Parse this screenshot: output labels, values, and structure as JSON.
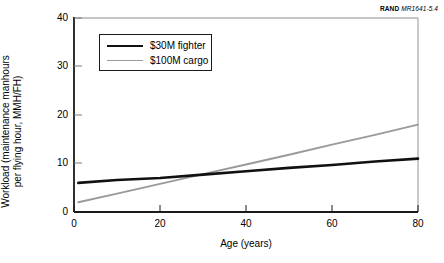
{
  "caption": {
    "wordmark": "RAND",
    "report_number": "MR1641-5.4"
  },
  "chart_data": {
    "type": "line",
    "title": "",
    "xlabel": "Age (years)",
    "ylabel": "Workload  (maintenance manhours per flying hour, MMH/FH)",
    "ylabel_line1": "Workload  (maintenance manhours",
    "ylabel_line2": "per flying hour, MMH/FH)",
    "xlim": [
      0,
      80
    ],
    "ylim": [
      0,
      40
    ],
    "xticks": [
      0,
      20,
      40,
      60,
      80
    ],
    "yticks": [
      0,
      10,
      20,
      30,
      40
    ],
    "xtick_labels": [
      "0",
      "20",
      "40",
      "60",
      "80"
    ],
    "ytick_labels": [
      "0",
      "10",
      "20",
      "30",
      "40"
    ],
    "grid": false,
    "legend_position": "upper left",
    "series": [
      {
        "name": "$30M fighter",
        "color": "#111111",
        "width": 2.6,
        "x": [
          1,
          10,
          20,
          30,
          40,
          50,
          60,
          70,
          80
        ],
        "values": [
          6.0,
          6.6,
          7.0,
          7.7,
          8.4,
          9.1,
          9.7,
          10.4,
          11.0
        ]
      },
      {
        "name": "$100M cargo",
        "color": "#9a9a9a",
        "width": 1.9,
        "x": [
          1,
          10,
          20,
          30,
          40,
          50,
          60,
          70,
          80
        ],
        "values": [
          2.0,
          3.8,
          5.8,
          7.8,
          9.8,
          11.8,
          13.9,
          15.9,
          18.0
        ]
      }
    ],
    "annotations": [
      {
        "text": "Series cross at approximately age 30, workload 7.7"
      }
    ]
  },
  "axis_tick_values": {
    "x": [
      "0",
      "20",
      "40",
      "60",
      "80"
    ],
    "y": [
      "0",
      "10",
      "20",
      "30",
      "40"
    ]
  }
}
